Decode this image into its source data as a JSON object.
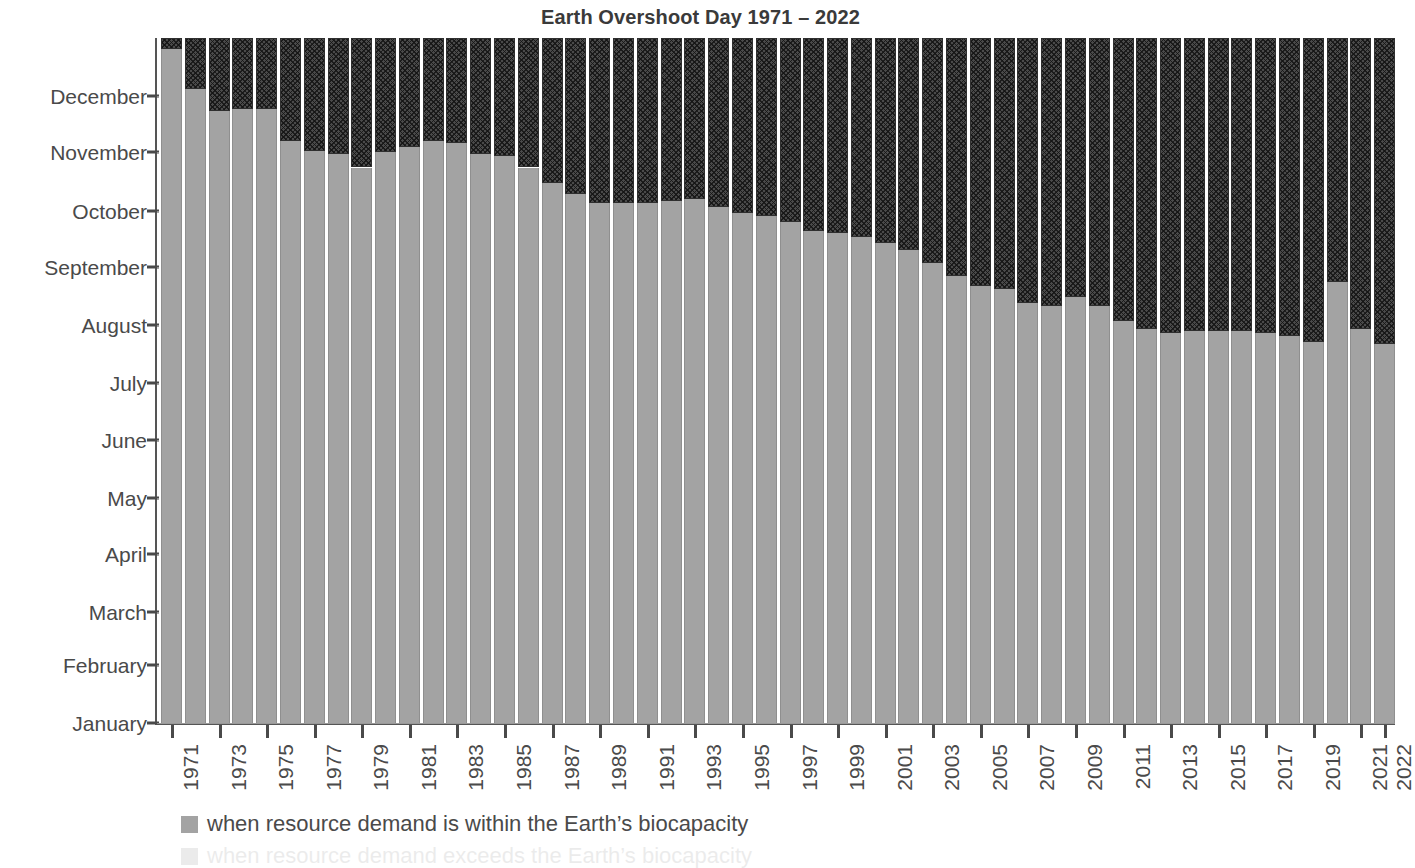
{
  "chart_data": {
    "type": "bar",
    "title": "Earth Overshoot Day 1971 – 2022",
    "xlabel": "",
    "ylabel": "",
    "grid": true,
    "stacked": true,
    "legend_position": "bottom-left",
    "ytick_labels": [
      "December",
      "November",
      "October",
      "September",
      "August",
      "July",
      "June",
      "May",
      "April",
      "March",
      "February",
      "January"
    ],
    "ytick_day_of_year": [
      334,
      304,
      273,
      243,
      212,
      181,
      151,
      120,
      90,
      59,
      31,
      0
    ],
    "ylim_day_of_year": [
      0,
      365
    ],
    "categories": [
      "1971",
      "1972",
      "1973",
      "1974",
      "1975",
      "1976",
      "1977",
      "1978",
      "1979",
      "1980",
      "1981",
      "1982",
      "1983",
      "1984",
      "1985",
      "1986",
      "1987",
      "1988",
      "1989",
      "1990",
      "1991",
      "1992",
      "1993",
      "1994",
      "1995",
      "1996",
      "1997",
      "1998",
      "1999",
      "2000",
      "2001",
      "2002",
      "2003",
      "2004",
      "2005",
      "2006",
      "2007",
      "2008",
      "2009",
      "2010",
      "2011",
      "2012",
      "2013",
      "2014",
      "2015",
      "2016",
      "2017",
      "2018",
      "2019",
      "2020",
      "2021",
      "2022"
    ],
    "xtick_labels_shown": [
      "1971",
      "1973",
      "1975",
      "1977",
      "1979",
      "1981",
      "1983",
      "1985",
      "1987",
      "1989",
      "1991",
      "1993",
      "1995",
      "1997",
      "1999",
      "2001",
      "2003",
      "2005",
      "2007",
      "2009",
      "2011",
      "2013",
      "2015",
      "2017",
      "2019",
      "2021",
      "2022"
    ],
    "series": [
      {
        "name": "when resource demand is within the Earth's biocapacity",
        "color": "#a3a3a3",
        "pattern": "solid",
        "unit": "day of year of Earth Overshoot Day",
        "values": [
          359,
          338,
          326,
          327,
          327,
          310,
          305,
          303,
          296,
          304,
          307,
          310,
          309,
          303,
          302,
          296,
          288,
          282,
          277,
          277,
          277,
          278,
          279,
          275,
          272,
          270,
          267,
          262,
          261,
          259,
          256,
          252,
          245,
          238,
          233,
          231,
          224,
          222,
          227,
          222,
          214,
          210,
          208,
          209,
          209,
          209,
          208,
          206,
          203,
          235,
          210,
          202
        ],
        "overshoot_dates": [
          "25 Dec 1971",
          "3 Dec 1972",
          "21 Nov 1973",
          "22 Nov 1974",
          "22 Nov 1975",
          "5 Nov 1976",
          "1 Nov 1977",
          "30 Oct 1978",
          "23 Oct 1979",
          "30 Oct 1980",
          "3 Nov 1981",
          "6 Nov 1982",
          "5 Nov 1983",
          "30 Oct 1984",
          "29 Oct 1985",
          "23 Oct 1986",
          "15 Oct 1987",
          "8 Oct 1988",
          "4 Oct 1989",
          "4 Oct 1990",
          "4 Oct 1991",
          "5 Oct 1992",
          "6 Oct 1993",
          "2 Oct 1994",
          "29 Sep 1995",
          "27 Sep 1996",
          "24 Sep 1997",
          "19 Sep 1998",
          "18 Sep 1999",
          "16 Sep 2000",
          "13 Sep 2001",
          "9 Sep 2002",
          "2 Sep 2003",
          "25 Aug 2004",
          "21 Aug 2005",
          "19 Aug 2006",
          "12 Aug 2007",
          "10 Aug 2008",
          "15 Aug 2009",
          "10 Aug 2010",
          "2 Aug 2011",
          "29 Jul 2012",
          "27 Jul 2013",
          "28 Jul 2014",
          "28 Jul 2015",
          "28 Jul 2016",
          "27 Jul 2017",
          "25 Jul 2018",
          "22 Jul 2019",
          "22 Aug 2020",
          "29 Jul 2021",
          "21 Jul 2022"
        ]
      },
      {
        "name": "when resource demand exceeds the Earth's biocapacity",
        "color": "#4a4a4a",
        "pattern": "cross-hatch",
        "unit": "days of overshoot remaining in the year",
        "values": [
          6,
          27,
          39,
          38,
          38,
          55,
          60,
          62,
          69,
          61,
          58,
          55,
          56,
          62,
          63,
          69,
          77,
          83,
          88,
          88,
          88,
          87,
          86,
          90,
          93,
          95,
          98,
          103,
          104,
          106,
          109,
          113,
          120,
          127,
          132,
          134,
          141,
          143,
          138,
          143,
          151,
          155,
          157,
          156,
          156,
          156,
          157,
          159,
          162,
          130,
          155,
          163
        ]
      }
    ]
  },
  "legend": {
    "entry1_label": "when resource demand is within the Earth’s biocapacity",
    "entry1_color": "#a3a3a3",
    "entry2_label": "when resource demand exceeds the Earth’s biocapacity",
    "entry2_color": "#4a4a4a"
  }
}
